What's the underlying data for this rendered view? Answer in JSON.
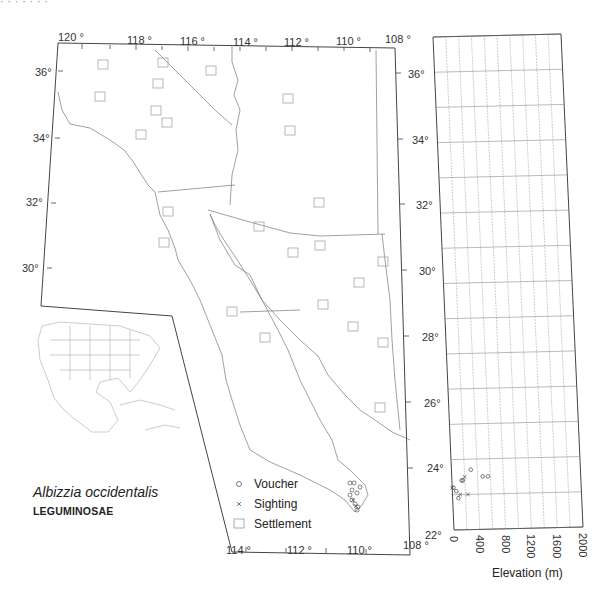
{
  "figure": {
    "species_name": "Albizzia occidentalis",
    "family_name": "LEGUMINOSAE",
    "header_fragment": "· · · · · · ·"
  },
  "map": {
    "lon_labels": [
      {
        "text": "120 °",
        "x": 58,
        "y": 32
      },
      {
        "text": "118 °",
        "x": 127,
        "y": 35
      },
      {
        "text": "116 °",
        "x": 180,
        "y": 36
      },
      {
        "text": "114 °",
        "x": 233,
        "y": 37
      },
      {
        "text": "112 °",
        "x": 284,
        "y": 37
      },
      {
        "text": "110 °",
        "x": 336,
        "y": 36
      },
      {
        "text": "108 °",
        "x": 385,
        "y": 34
      }
    ],
    "lat_labels_left": [
      {
        "text": "36°",
        "x": 35,
        "y": 67
      },
      {
        "text": "34°",
        "x": 33,
        "y": 133
      },
      {
        "text": "32°",
        "x": 26,
        "y": 197
      },
      {
        "text": "30°",
        "x": 22,
        "y": 263
      }
    ],
    "lat_labels_right": [
      {
        "text": "36°",
        "x": 408,
        "y": 69
      },
      {
        "text": "34°",
        "x": 412,
        "y": 135
      },
      {
        "text": "32°",
        "x": 416,
        "y": 200
      },
      {
        "text": "30°",
        "x": 419,
        "y": 266
      },
      {
        "text": "28°",
        "x": 422,
        "y": 332
      },
      {
        "text": "26°",
        "x": 424,
        "y": 398
      },
      {
        "text": "24°",
        "x": 427,
        "y": 463
      },
      {
        "text": "22°",
        "x": 425,
        "y": 530
      }
    ],
    "lon_labels_bottom": [
      {
        "text": "114 °",
        "x": 226,
        "y": 545
      },
      {
        "text": "112 °",
        "x": 287,
        "y": 545
      },
      {
        "text": "110 °",
        "x": 347,
        "y": 545
      },
      {
        "text": "108 °",
        "x": 403,
        "y": 540
      }
    ],
    "settlements": [
      [
        163,
        63
      ],
      [
        211,
        71
      ],
      [
        103,
        65
      ],
      [
        158,
        84
      ],
      [
        100,
        97
      ],
      [
        156,
        111
      ],
      [
        288,
        99
      ],
      [
        290,
        131
      ],
      [
        167,
        123
      ],
      [
        319,
        203
      ],
      [
        259,
        227
      ],
      [
        320,
        246
      ],
      [
        383,
        262
      ],
      [
        293,
        253
      ],
      [
        359,
        283
      ],
      [
        323,
        305
      ],
      [
        164,
        243
      ],
      [
        232,
        312
      ],
      [
        353,
        327
      ],
      [
        383,
        343
      ],
      [
        265,
        338
      ],
      [
        380,
        408
      ],
      [
        168,
        212
      ],
      [
        141,
        135
      ]
    ],
    "vouchers": [
      [
        350,
        483
      ],
      [
        354,
        483
      ],
      [
        352,
        490
      ],
      [
        360,
        487
      ],
      [
        357,
        493
      ],
      [
        350,
        495
      ],
      [
        352,
        500
      ],
      [
        355,
        504
      ],
      [
        358,
        507
      ],
      [
        357,
        510
      ]
    ],
    "sightings": [
      [
        353,
        500
      ],
      [
        356,
        506
      ]
    ]
  },
  "legend": {
    "items": [
      {
        "symbol": "o",
        "label": "Voucher"
      },
      {
        "symbol": "×",
        "label": "Sighting"
      },
      {
        "symbol": "□",
        "label": "Settlement"
      }
    ]
  },
  "chart_data": {
    "type": "scatter",
    "title": "",
    "xlabel": "Elevation (m)",
    "ylabel": "Latitude",
    "xlim": [
      0,
      2000
    ],
    "ylim": [
      22,
      36
    ],
    "x_ticks": [
      "0",
      "400",
      "800",
      "1200",
      "1600",
      "2000"
    ],
    "y_ticks": [
      "22°",
      "24°",
      "26°",
      "28°",
      "30°",
      "32°",
      "34°",
      "36°"
    ],
    "grid": true,
    "series": [
      {
        "name": "Voucher",
        "marker": "o",
        "points": [
          {
            "elevation": 20,
            "lat": 23.2
          },
          {
            "elevation": 60,
            "lat": 23.1
          },
          {
            "elevation": 90,
            "lat": 22.9
          },
          {
            "elevation": 150,
            "lat": 23.4
          },
          {
            "elevation": 170,
            "lat": 23.4
          },
          {
            "elevation": 300,
            "lat": 23.7
          },
          {
            "elevation": 480,
            "lat": 23.5
          },
          {
            "elevation": 560,
            "lat": 23.5
          }
        ]
      },
      {
        "name": "Sighting",
        "marker": "x",
        "points": [
          {
            "elevation": 0,
            "lat": 23.2
          },
          {
            "elevation": 120,
            "lat": 23.0
          },
          {
            "elevation": 200,
            "lat": 23.5
          },
          {
            "elevation": 240,
            "lat": 23.0
          }
        ]
      }
    ]
  }
}
